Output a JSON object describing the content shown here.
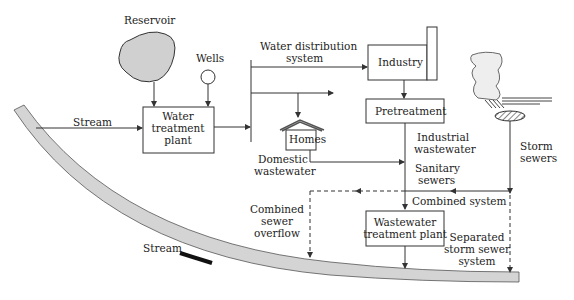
{
  "labels": {
    "reservoir": "Reservoir",
    "wells": "Wells",
    "stream_in": "Stream",
    "water_treatment": [
      "Water",
      "treatment",
      "plant"
    ],
    "water_distribution": [
      "Water distribution",
      "system"
    ],
    "industry": "Industry",
    "pretreatment": "Pretreatment",
    "homes": "Homes",
    "domestic_wastewater": [
      "Domestic",
      "wastewater"
    ],
    "industrial_wastewater": [
      "Industrial",
      "wastewater"
    ],
    "sanitary_sewers": [
      "Sanitary",
      "sewers"
    ],
    "storm_sewers": [
      "Storm",
      "sewers"
    ],
    "combined_system": "Combined system",
    "combined_sewer_overflow": [
      "Combined",
      "sewer",
      "overflow"
    ],
    "wastewater_treatment": [
      "Wastewater",
      "treatment plant"
    ],
    "separated_storm": [
      "Separated",
      "storm sewer",
      "system"
    ],
    "stream_flow": "Stream"
  },
  "colors": {
    "stream_fill": "#d4d4d4",
    "reservoir_fill": "#d0d0d0",
    "line": "#333333"
  }
}
